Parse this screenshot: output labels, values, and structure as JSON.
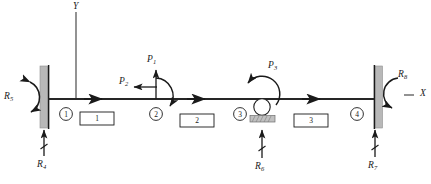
{
  "diagram": {
    "axes": {
      "y_label": "Y",
      "x_label": "X"
    },
    "nodes": [
      {
        "id": "1",
        "label": "1",
        "x": 66,
        "y": 114
      },
      {
        "id": "2",
        "label": "2",
        "x": 156,
        "y": 114
      },
      {
        "id": "3",
        "label": "3",
        "x": 240,
        "y": 114
      },
      {
        "id": "4",
        "label": "4",
        "x": 357,
        "y": 114
      }
    ],
    "elements": [
      {
        "id": "1",
        "label": "1",
        "x": 97,
        "y": 118
      },
      {
        "id": "2",
        "label": "2",
        "x": 197,
        "y": 120
      },
      {
        "id": "3",
        "label": "3",
        "x": 311,
        "y": 120
      }
    ],
    "loads": [
      {
        "name": "P1",
        "letter": "P",
        "sub": "1",
        "type": "force-vertical-up",
        "x": 151,
        "y": 61
      },
      {
        "name": "P2",
        "letter": "P",
        "sub": "2",
        "type": "force-horizontal-left",
        "x": 123,
        "y": 84
      },
      {
        "name": "P3",
        "letter": "P",
        "sub": "3",
        "type": "moment-counterclockwise",
        "x": 271,
        "y": 67
      }
    ],
    "reactions": [
      {
        "name": "R4",
        "letter": "R",
        "sub": "4",
        "type": "force-vertical-up",
        "x": 40,
        "y": 166
      },
      {
        "name": "R5",
        "letter": "R",
        "sub": "5",
        "type": "moment",
        "x": 4,
        "y": 97
      },
      {
        "name": "R6",
        "letter": "R",
        "sub": "6",
        "type": "force-vertical-up",
        "x": 249,
        "y": 166
      },
      {
        "name": "R7",
        "letter": "R",
        "sub": "7",
        "type": "force-vertical-up",
        "x": 363,
        "y": 166
      },
      {
        "name": "R8",
        "letter": "R",
        "sub": "8",
        "type": "moment",
        "x": 399,
        "y": 76
      },
      {
        "name": "X-axis",
        "letter": "X",
        "sub": "",
        "type": "axis",
        "x": 421,
        "y": 99
      },
      {
        "name": "Y-axis",
        "letter": "Y",
        "sub": "",
        "type": "axis",
        "x": 73,
        "y": 3
      }
    ],
    "supports": [
      {
        "name": "fixed-wall-left",
        "x": 44,
        "y": 66
      },
      {
        "name": "roller-support",
        "x": 262,
        "y": 100
      },
      {
        "name": "fixed-wall-right",
        "x": 375,
        "y": 66
      }
    ],
    "colors": {
      "line": "#262626",
      "wall_fill": "#b8b8b8",
      "roller_base": "#c0c0c0",
      "text": "#1a1a1a"
    }
  }
}
